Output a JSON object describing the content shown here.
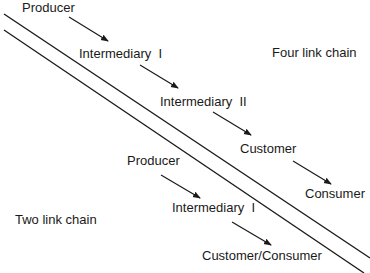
{
  "diagram": {
    "four_link_chain": {
      "title": "Four link chain",
      "nodes": [
        "Producer",
        "Intermediary  I",
        "Intermediary  II",
        "Customer",
        "Consumer"
      ]
    },
    "two_link_chain": {
      "title": "Two link chain",
      "nodes": [
        "Producer",
        "Intermediary  I",
        "Customer/Consumer"
      ]
    },
    "colors": {
      "stroke": "#1a1a1a",
      "background": "#ffffff"
    }
  }
}
